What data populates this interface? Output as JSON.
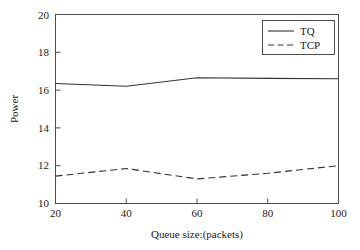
{
  "chart_data": {
    "type": "line",
    "title": "",
    "xlabel": "Queue size:(packets)",
    "ylabel": "Power",
    "x": [
      20,
      40,
      60,
      80,
      100
    ],
    "xlim": [
      20,
      100
    ],
    "ylim": [
      10,
      20
    ],
    "xticks": [
      "20",
      "40",
      "60",
      "80",
      "100"
    ],
    "yticks": [
      "10",
      "12",
      "14",
      "16",
      "18",
      "20"
    ],
    "grid": false,
    "legend_position": "top-right",
    "series": [
      {
        "name": "TQ",
        "style": "solid",
        "values": [
          16.35,
          16.2,
          16.65,
          16.62,
          16.6
        ]
      },
      {
        "name": "TCP",
        "style": "dashed",
        "values": [
          11.45,
          11.85,
          11.3,
          11.6,
          12.0
        ]
      }
    ]
  },
  "legend": {
    "entries": [
      {
        "label": "TQ"
      },
      {
        "label": "TCP"
      }
    ]
  }
}
